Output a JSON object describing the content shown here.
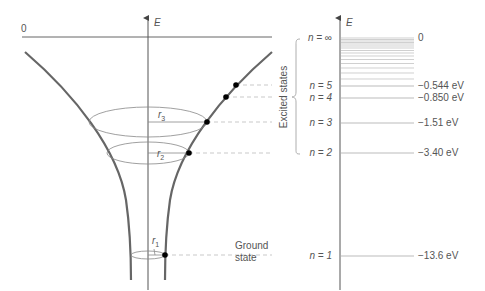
{
  "left_panel": {
    "axis_label": "E",
    "zero_label": "0",
    "radius_labels": [
      "r",
      "r",
      "r"
    ],
    "radius_subscripts": [
      "3",
      "2",
      "1"
    ],
    "ground_state_label": [
      "Ground",
      "state"
    ]
  },
  "right_panel": {
    "axis_label": "E",
    "bracket_label": "Excited states",
    "levels": [
      {
        "n_label": "n = ∞",
        "energy": "0"
      },
      {
        "n_label": "n = 5",
        "energy": "−0.544 eV"
      },
      {
        "n_label": "n = 4",
        "energy": "−0.850 eV"
      },
      {
        "n_label": "n = 3",
        "energy": "−1.51 eV"
      },
      {
        "n_label": "n = 2",
        "energy": "−3.40 eV"
      },
      {
        "n_label": "n = 1",
        "energy": "−13.6 eV"
      }
    ]
  },
  "colors": {
    "curve": "#666666",
    "axis": "#444444",
    "level": "#aaaaaa",
    "dashed": "#bbbbbb",
    "dot": "#000000",
    "text": "#555555"
  }
}
